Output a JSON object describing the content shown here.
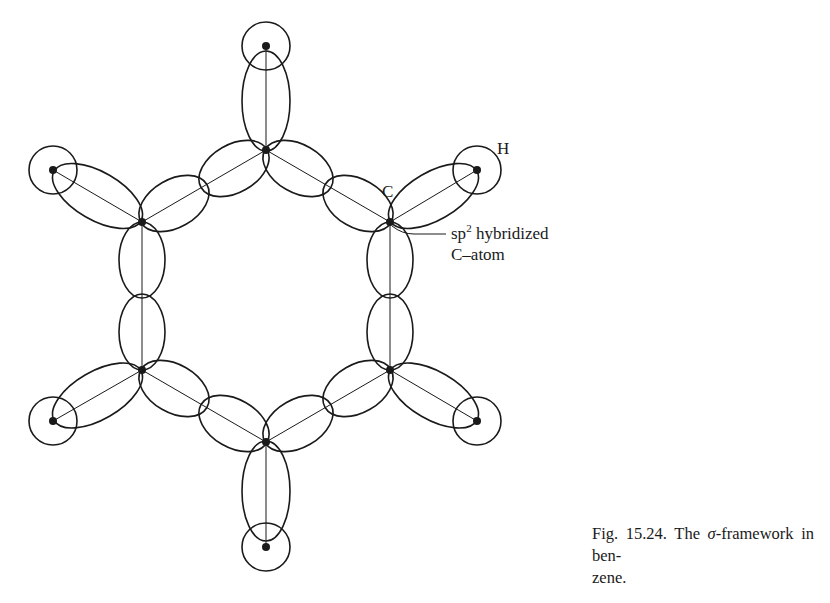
{
  "figure": {
    "number_label": "Fig. 15.24.",
    "caption_before_symbol": "The ",
    "caption_symbol": "σ",
    "caption_after_symbol": "-framework in ben-zene.",
    "caption_line1_after": "-framework in ben-",
    "caption_line2": "zene."
  },
  "labels": {
    "hydrogen": "H",
    "carbon": "C",
    "annotation_line1_base": "sp",
    "annotation_line1_sup": "2",
    "annotation_line1_rest": " hybridized",
    "annotation_line2": "C–atom"
  },
  "molecule": {
    "name": "benzene",
    "colors": {
      "stroke": "#1a1a1a",
      "background": "#ffffff"
    },
    "carbon_atoms": [
      {
        "id": "C1",
        "x": 266,
        "y": 150
      },
      {
        "id": "C2",
        "x": 390,
        "y": 222
      },
      {
        "id": "C3",
        "x": 390,
        "y": 370
      },
      {
        "id": "C4",
        "x": 266,
        "y": 442
      },
      {
        "id": "C5",
        "x": 142,
        "y": 370
      },
      {
        "id": "C6",
        "x": 142,
        "y": 222
      }
    ],
    "hydrogen_atoms": [
      {
        "id": "H1",
        "x": 266,
        "y": 46
      },
      {
        "id": "H2",
        "x": 477,
        "y": 170
      },
      {
        "id": "H3",
        "x": 477,
        "y": 421
      },
      {
        "id": "H4",
        "x": 266,
        "y": 547
      },
      {
        "id": "H5",
        "x": 53,
        "y": 421
      },
      {
        "id": "H6",
        "x": 53,
        "y": 170
      }
    ],
    "bonds": {
      "carbon_carbon": 6,
      "carbon_hydrogen": 6,
      "orbital_type": "sp2 hybrid lobes overlapping with H 1s orbitals"
    }
  }
}
